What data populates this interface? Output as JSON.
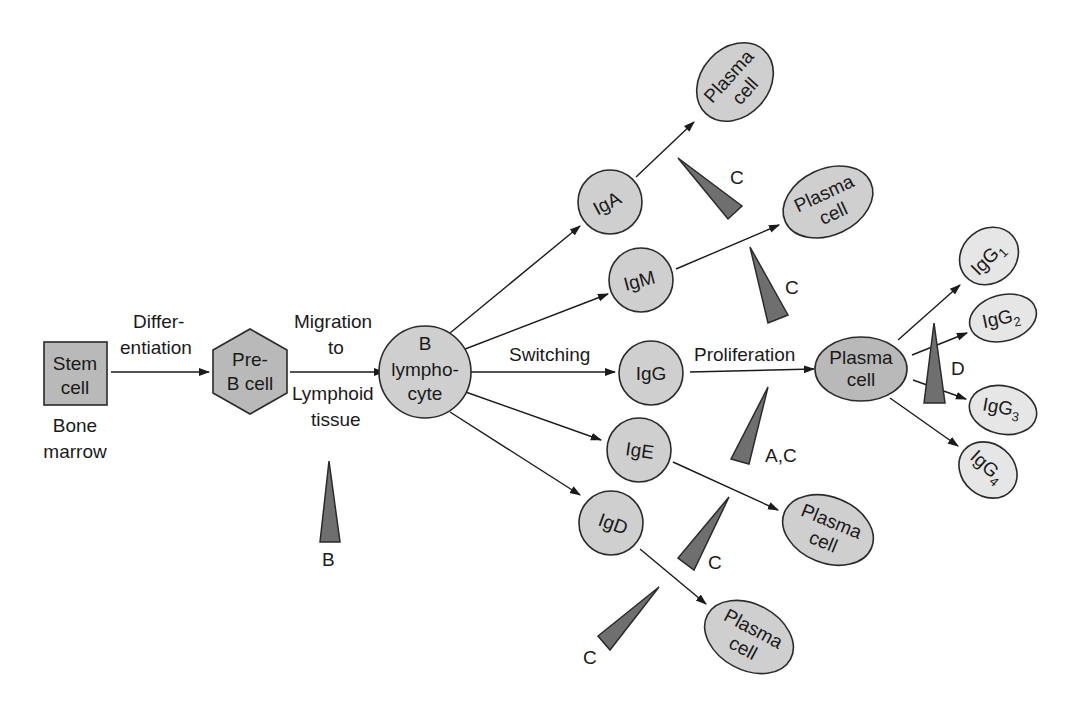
{
  "diagram": {
    "nodes": {
      "stem_cell": {
        "line1": "Stem",
        "line2": "cell",
        "shape": "square"
      },
      "bone_marrow": {
        "line1": "Bone",
        "line2": "marrow"
      },
      "pre_b_cell": {
        "line1": "Pre-",
        "line2": "B cell",
        "shape": "hexagon"
      },
      "b_lymphocyte": {
        "line1": "B",
        "line2": "lympho-",
        "line3": "cyte",
        "shape": "circle"
      },
      "iga": {
        "label": "IgA"
      },
      "igm": {
        "label": "IgM"
      },
      "igg": {
        "label": "IgG"
      },
      "ige": {
        "label": "IgE"
      },
      "igd": {
        "label": "IgD"
      },
      "plasma_iga": {
        "line1": "Plasma",
        "line2": "cell"
      },
      "plasma_igm": {
        "line1": "Plasma",
        "line2": "cell"
      },
      "plasma_igg": {
        "line1": "Plasma",
        "line2": "cell"
      },
      "plasma_ige": {
        "line1": "Plasma",
        "line2": "cell"
      },
      "plasma_igd": {
        "line1": "Plasma",
        "line2": "cell"
      },
      "igg1": {
        "base": "IgG",
        "sub": "1"
      },
      "igg2": {
        "base": "IgG",
        "sub": "2"
      },
      "igg3": {
        "base": "IgG",
        "sub": "3"
      },
      "igg4": {
        "base": "IgG",
        "sub": "4"
      }
    },
    "edge_labels": {
      "differentiation_1": "Differ-",
      "differentiation_2": "entiation",
      "migration_1": "Migration",
      "migration_2": "to",
      "migration_3": "Lymphoid",
      "migration_4": "tissue",
      "switching": "Switching",
      "proliferation": "Proliferation"
    },
    "wedge_labels": {
      "migration": "B",
      "iga": "C",
      "igm": "C",
      "igg": "A,C",
      "ige": "C",
      "igd": "C",
      "subclass": "D"
    },
    "colors": {
      "shape_dark": "#b9b9b9",
      "shape_mid": "#cfcfcf",
      "shape_light": "#e6e6e6",
      "wedge": "#6f6f6f",
      "stroke": "#2a2a2a"
    }
  }
}
